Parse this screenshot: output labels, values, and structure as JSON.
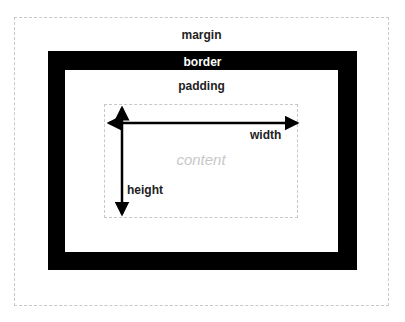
{
  "diagram": {
    "layers": {
      "margin": {
        "label": "margin",
        "style": "dashed outline",
        "color": "#c8c8c8"
      },
      "border": {
        "label": "border",
        "fill": "#000000",
        "label_color": "#ffffff"
      },
      "padding": {
        "label": "padding",
        "fill": "#ffffff"
      },
      "content": {
        "label": "content",
        "style": "dashed outline",
        "label_color": "#c8c8c8"
      }
    },
    "dimensions": {
      "width": {
        "label": "width"
      },
      "height": {
        "label": "height"
      }
    }
  }
}
